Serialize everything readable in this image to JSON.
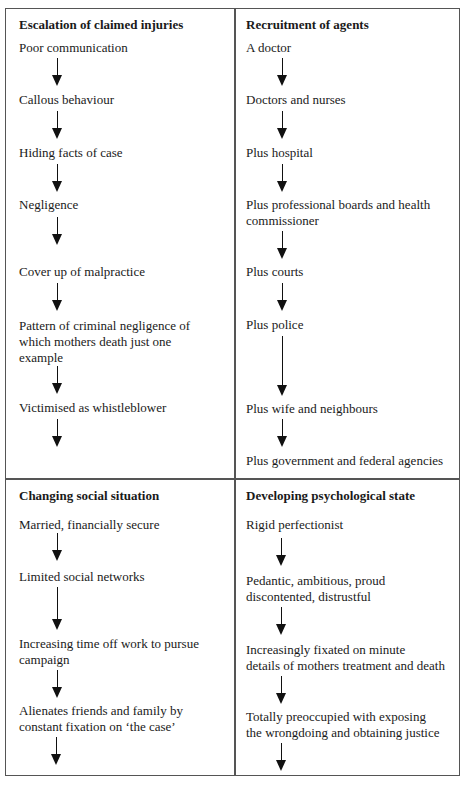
{
  "panels": [
    {
      "title": "Escalation of claimed injuries",
      "items": [
        "Poor communication",
        "Callous behaviour",
        "Hiding facts of case",
        "Negligence",
        "Cover up of malpractice",
        "Pattern of criminal negligence of",
        "which mothers death just one",
        "example",
        "Victimised as whistleblower"
      ]
    },
    {
      "title": "Recruitment of agents",
      "items": [
        "A doctor",
        "Doctors and nurses",
        "Plus hospital",
        "Plus professional boards and health",
        "commissioner",
        "Plus courts",
        "Plus police",
        "Plus wife and neighbours",
        "Plus government and federal agencies"
      ]
    },
    {
      "title": "Changing social situation",
      "items": [
        "Married, financially secure",
        "Limited social networks",
        "Increasing time off work to pursue",
        "campaign",
        "Alienates friends and family by",
        "constant fixation on ‘the case’"
      ]
    },
    {
      "title": "Developing psychological state",
      "items": [
        "Rigid perfectionist",
        "Pedantic, ambitious, proud",
        "discontented, distrustful",
        "Increasingly fixated on minute",
        "details of mothers treatment and death",
        "Totally preoccupied with exposing",
        "the wrongdoing and obtaining justice"
      ]
    }
  ]
}
